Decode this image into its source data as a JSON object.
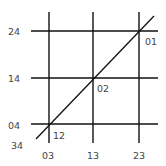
{
  "diagram": {
    "type": "grid-with-diagonal",
    "colors": {
      "line": "#111111",
      "text": "#444444",
      "background": "#ffffff"
    },
    "vertical_lines": [
      {
        "x": 49,
        "y1": 12,
        "y2": 143
      },
      {
        "x": 93,
        "y1": 12,
        "y2": 143
      },
      {
        "x": 139,
        "y1": 12,
        "y2": 143
      }
    ],
    "horizontal_lines": [
      {
        "y": 31,
        "x1": 31,
        "x2": 158
      },
      {
        "y": 78,
        "x1": 31,
        "x2": 158
      },
      {
        "y": 124,
        "x1": 31,
        "x2": 158
      }
    ],
    "diagonal": {
      "x1": 36,
      "y1": 139,
      "x2": 154,
      "y2": 16
    },
    "row_labels": [
      {
        "text": "24",
        "x": 8,
        "y": 35
      },
      {
        "text": "14",
        "x": 8,
        "y": 82
      },
      {
        "text": "04",
        "x": 8,
        "y": 129
      }
    ],
    "column_labels": [
      {
        "text": "03",
        "x": 42,
        "y": 159
      },
      {
        "text": "13",
        "x": 87,
        "y": 159
      },
      {
        "text": "23",
        "x": 133,
        "y": 159
      }
    ],
    "corner_label": {
      "text": "34",
      "x": 11,
      "y": 149
    },
    "intersection_labels": [
      {
        "text": "01",
        "x": 145,
        "y": 45
      },
      {
        "text": "02",
        "x": 97,
        "y": 92
      },
      {
        "text": "12",
        "x": 53,
        "y": 139
      }
    ]
  }
}
